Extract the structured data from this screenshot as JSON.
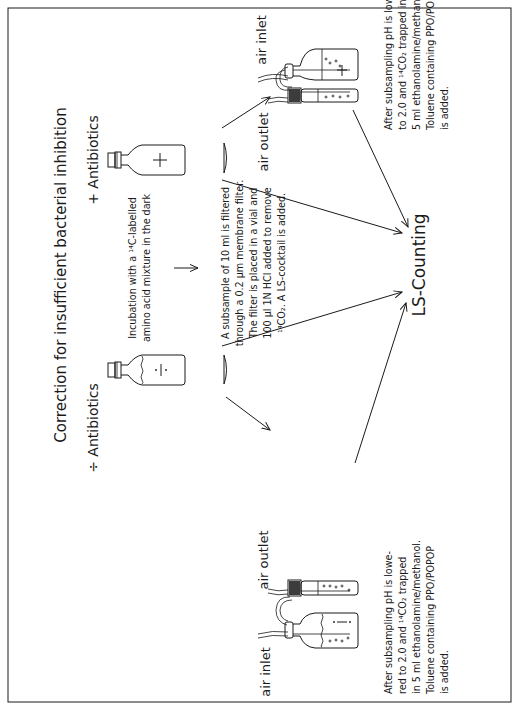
{
  "figure": {
    "title": "Correction for insufficient bacterial inhibition",
    "orientation": "rotated 90° counter-clockwise",
    "branches": {
      "plus": {
        "label": "+ Antibiotics",
        "bottle_symbol": "+"
      },
      "minus": {
        "label": "÷ Antibiotics",
        "bottle_symbol": "÷"
      }
    },
    "incubation": {
      "lines": [
        "Incubation with a  ¹⁴C-labelled",
        "amino acid mixture in the dark"
      ]
    },
    "filtration": {
      "lines": [
        "A subsample of 10 ml is filtered",
        "through a 0.2 µm membrane filter.",
        "The filter is placed in a vial and",
        "100 µl 1N HCl added to remove",
        "¹⁴CO₂. A LS-cocktail is added."
      ]
    },
    "apparatus_top": {
      "air_inlet_label": "air inlet",
      "air_outlet_label": "air outlet",
      "note_lines": [
        "After subsampling pH is lowe-",
        "to 2.0 and ¹⁴CO₂  trapped  in",
        "5 ml ethanolamine/methanol.",
        "Toluene containing PPO/POPOP",
        "is added."
      ]
    },
    "apparatus_bottom": {
      "air_inlet_label": "air inlet",
      "air_outlet_label": "air outlet",
      "note_lines": [
        "After subsampling pH is lowe-",
        "red to 2.0 and ¹⁴CO₂ trapped",
        "in 5 ml ethanolamine/methanol.",
        "Toluene containing PPO/POPOP",
        "is added."
      ]
    },
    "result": {
      "label": "LS-Counting"
    },
    "colors": {
      "ink": "#1a1a1a",
      "paper": "#ffffff"
    }
  }
}
